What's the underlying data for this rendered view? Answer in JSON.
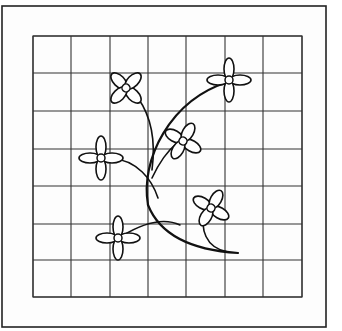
{
  "figure": {
    "frame": {
      "x": 2,
      "y": 6,
      "w": 324,
      "h": 321
    },
    "grid": {
      "x_lines": [
        33,
        71,
        110,
        148,
        186,
        225,
        263,
        302
      ],
      "y_lines": [
        36,
        73,
        111,
        149,
        186,
        224,
        260,
        297
      ],
      "rows": 7,
      "cols": 7
    },
    "stems": [
      {
        "name": "main-stem-upper-right",
        "d": "M 148 205 C 140 160, 170 100, 228 82",
        "weight": "thick"
      },
      {
        "name": "main-stem-lower",
        "d": "M 148 205 C 160 235, 190 250, 238 253",
        "weight": "thick"
      },
      {
        "name": "stem-upper-left-flower",
        "d": "M 152 170 C 156 140, 150 115, 138 98",
        "weight": "thin"
      },
      {
        "name": "stem-left-flower",
        "d": "M 158 198 C 152 180, 138 160, 110 158",
        "weight": "thin"
      },
      {
        "name": "stem-mid-flower",
        "d": "M 152 178 C 158 165, 166 152, 178 142",
        "weight": "thin"
      },
      {
        "name": "stem-bottom-left-flower",
        "d": "M 180 225 C 165 218, 145 222, 122 236",
        "weight": "thin"
      },
      {
        "name": "stem-bottom-right-flower",
        "d": "M 228 252 C 205 248, 200 228, 205 212",
        "weight": "thin"
      }
    ],
    "flowers": [
      {
        "name": "flower-top-left",
        "cx": 126,
        "cy": 88,
        "rotate": 45,
        "rx": 10,
        "ry": 5.5,
        "offset": 10,
        "center_r": 4
      },
      {
        "name": "flower-top-right",
        "cx": 229,
        "cy": 80,
        "rotate": 0,
        "rx": 11,
        "ry": 5,
        "offset": 11,
        "center_r": 4
      },
      {
        "name": "flower-middle",
        "cx": 183,
        "cy": 141,
        "rotate": 30,
        "rx": 10,
        "ry": 5.5,
        "offset": 10,
        "center_r": 4
      },
      {
        "name": "flower-left",
        "cx": 101,
        "cy": 158,
        "rotate": 0,
        "rx": 11,
        "ry": 5,
        "offset": 11,
        "center_r": 4
      },
      {
        "name": "flower-bottom-right",
        "cx": 211,
        "cy": 208,
        "rotate": 30,
        "rx": 10,
        "ry": 5.5,
        "offset": 10,
        "center_r": 4
      },
      {
        "name": "flower-bottom-left",
        "cx": 118,
        "cy": 238,
        "rotate": 0,
        "rx": 11,
        "ry": 5,
        "offset": 11,
        "center_r": 4
      }
    ],
    "colors": {
      "ink": "#111111",
      "grid": "#333333",
      "paper": "#fdfdfd"
    }
  }
}
